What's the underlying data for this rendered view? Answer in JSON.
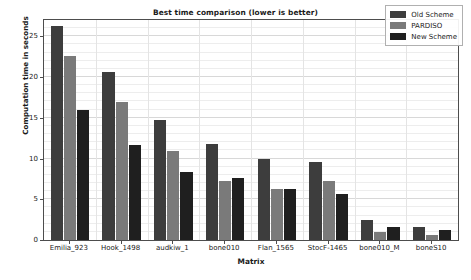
{
  "chart_data": {
    "type": "bar",
    "title": "Best time comparison (lower is better)",
    "xlabel": "Matrix",
    "ylabel": "Computation time in seconds",
    "ylim": [
      0,
      27
    ],
    "yticks": [
      0,
      5,
      10,
      15,
      20,
      25
    ],
    "ytick_labels": [
      "0",
      "5",
      "10",
      "15",
      "20",
      "25"
    ],
    "grid": true,
    "legend_position": "upper right",
    "categories": [
      "Emilia_923",
      "Hook_1498",
      "audkiw_1",
      "bone010",
      "Flan_1565",
      "StocF-1465",
      "bone010_M",
      "boneS10"
    ],
    "series": [
      {
        "name": "Old Scheme",
        "color": "#3d3d3d",
        "values": [
          26.3,
          20.6,
          14.7,
          11.8,
          9.9,
          9.6,
          2.5,
          1.6
        ]
      },
      {
        "name": "PARDISO",
        "color": "#7a7a7a",
        "values": [
          22.6,
          16.9,
          10.9,
          7.3,
          6.3,
          7.3,
          1.0,
          0.6
        ]
      },
      {
        "name": "New Scheme",
        "color": "#1f1f1f",
        "values": [
          16.0,
          11.6,
          8.3,
          7.6,
          6.2,
          5.6,
          1.6,
          1.2
        ]
      }
    ]
  },
  "colors": {
    "axis": "#4d4d4d",
    "grid_major": "#d8d8d8",
    "grid_minor": "#ededed",
    "text": "#1a1a1a",
    "background": "#ffffff"
  }
}
